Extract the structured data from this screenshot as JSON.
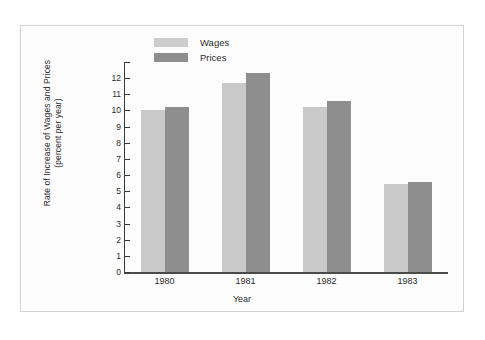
{
  "chart_data": {
    "type": "bar",
    "title": "",
    "xlabel": "Year",
    "ylabel": "Rate of Increase of Wages and Prices\n(percent per year)",
    "categories": [
      "1980",
      "1981",
      "1982",
      "1983"
    ],
    "series": [
      {
        "name": "Wages",
        "values": [
          10.05,
          11.7,
          10.2,
          5.45
        ],
        "color": "#c9c9c9"
      },
      {
        "name": "Prices",
        "values": [
          10.2,
          12.35,
          10.6,
          5.6
        ],
        "color": "#8e8e8e"
      }
    ],
    "ylim": [
      0,
      13
    ],
    "yticks": [
      0,
      1,
      2,
      3,
      4,
      5,
      6,
      7,
      8,
      9,
      10,
      11,
      12,
      13
    ],
    "ytick_labels": [
      "0",
      "1",
      "2",
      "3",
      "4",
      "5",
      "6",
      "7",
      "8",
      "9",
      "10",
      "11",
      "12",
      ""
    ],
    "grid": false,
    "legend_position": "top-center"
  },
  "legend": {
    "items": [
      {
        "label": "Wages"
      },
      {
        "label": "Prices"
      }
    ]
  },
  "axes": {
    "y_title": "Rate of Increase of Wages and Prices\n(percent per year)",
    "x_title": "Year"
  }
}
